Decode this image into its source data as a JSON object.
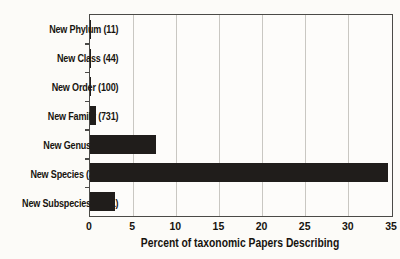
{
  "chart_data": {
    "type": "bar",
    "orientation": "horizontal",
    "title": "",
    "xlabel": "Percent of taxonomic Papers Describing",
    "ylabel": "",
    "categories": [
      "New Phylum (11)",
      "New Class (44)",
      "New Order (100)",
      "New Family (731)",
      "New Genus (8597)",
      "New Species (38,590)",
      "New Subspecies (3231)"
    ],
    "counts": [
      11,
      44,
      100,
      731,
      8597,
      38590,
      3231
    ],
    "values": [
      0.01,
      0.04,
      0.09,
      0.65,
      7.7,
      34.5,
      2.9
    ],
    "xlim": [
      0,
      35
    ],
    "xticks": [
      0,
      5,
      10,
      15,
      20,
      25,
      30,
      35
    ],
    "grid": "vertical-gridlines-every-5",
    "legend": "none",
    "colors": {
      "bar": "#201d1b",
      "gridline": "#c9c7c2",
      "border": "#4b4a47",
      "text": "#17140f",
      "background": "#fcfbf8"
    }
  }
}
